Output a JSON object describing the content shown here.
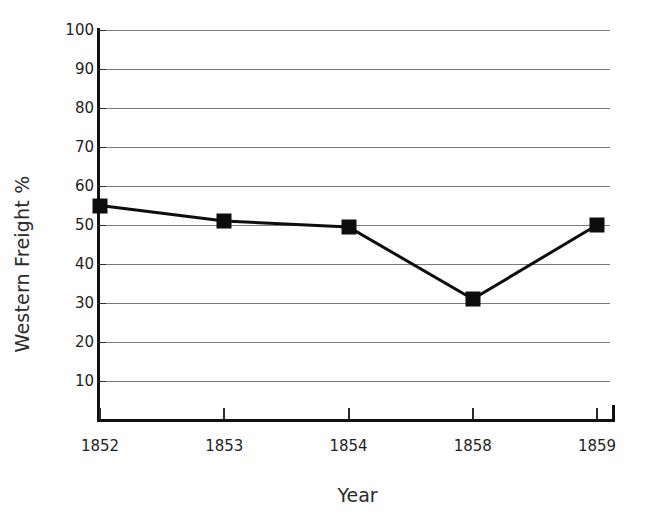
{
  "chart_data": {
    "type": "line",
    "title": "",
    "xlabel": "Year",
    "ylabel": "Western Freight %",
    "categories": [
      "1852",
      "1853",
      "1854",
      "1858",
      "1859"
    ],
    "values": [
      55,
      51,
      49.5,
      31,
      50
    ],
    "series": [
      {
        "name": "Western Freight %",
        "values": [
          55,
          51,
          49.5,
          31,
          50
        ]
      }
    ],
    "ylim": [
      0,
      100
    ],
    "ytick_labels": [
      "100",
      "90",
      "80",
      "70",
      "60",
      "50",
      "40",
      "30",
      "20",
      "10"
    ],
    "ytick_values": [
      100,
      90,
      80,
      70,
      60,
      50,
      40,
      30,
      20,
      10
    ],
    "grid": "horizontal",
    "legend": "none",
    "marker": "filled-square",
    "line_color": "#0d0d0d",
    "marker_color": "#0d0d0d",
    "grid_color": "#7a7a7a",
    "axis_color": "#111111",
    "background": "#fefefe"
  }
}
